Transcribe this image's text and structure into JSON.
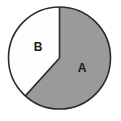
{
  "figure": {
    "kind": "pie-chart",
    "background_color": "#ffffff",
    "outline_color": "#2b2b2b",
    "outline_width": 1.6,
    "center": {
      "x": 59.5,
      "y": 58
    },
    "radius": 51
  },
  "chart_data": {
    "type": "pie",
    "title": "",
    "subtitle": "",
    "xlabel": "",
    "ylabel": "",
    "grid": false,
    "legend": "none",
    "labels_inside_slices": true,
    "start_angle_deg": 0,
    "direction": "clockwise",
    "categories": [
      "A",
      "B"
    ],
    "values": [
      61.7,
      38.3
    ],
    "value_unit": "percent",
    "slices": [
      {
        "label": "A",
        "value": 61.7,
        "angle_deg": 222,
        "start_angle_deg": 0,
        "end_angle_deg": 222,
        "color": "#9a9a9a",
        "label_x": 82,
        "label_y": 69
      },
      {
        "label": "B",
        "value": 38.3,
        "angle_deg": 138,
        "start_angle_deg": 222,
        "end_angle_deg": 360,
        "color": "#fefefe",
        "label_x": 38,
        "label_y": 48
      }
    ]
  }
}
